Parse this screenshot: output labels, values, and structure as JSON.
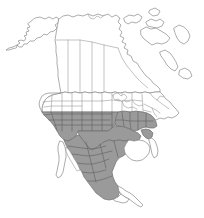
{
  "figure": {
    "type": "range-map",
    "width": 204,
    "height": 218,
    "background_color": "#ffffff",
    "has_legend": false,
    "has_labels": false,
    "has_title_text": false,
    "has_scale_bar": false,
    "has_compass": false,
    "has_graticule": false
  },
  "colors": {
    "background": "#ffffff",
    "land_fill": "#ffffff",
    "coastline_stroke": "#8a8a8a",
    "subdivision_stroke": "#9a9a9a",
    "range_fill": "#9a9a9a",
    "range_stroke": "#6f6f6f",
    "range_subdivision_stroke": "#5f5f5f"
  },
  "map": {
    "projection_extent": "North America including Alaska, Canada, Greenland margin, continental United States, Mexico and Central America approach",
    "regions": [
      {
        "id": "alaska",
        "label": "Alaska",
        "shaded": false
      },
      {
        "id": "canada",
        "label": "Canada",
        "shaded": false,
        "has_province_divisions": true
      },
      {
        "id": "united-states",
        "label": "United States",
        "shaded": "partial",
        "has_state_divisions": true
      },
      {
        "id": "mexico",
        "label": "Mexico",
        "shaded": "partial",
        "has_state_divisions": true
      },
      {
        "id": "baja-california",
        "label": "Baja California Peninsula",
        "shaded": false
      },
      {
        "id": "yucatan",
        "label": "Yucatan Peninsula",
        "shaded": false
      },
      {
        "id": "great-lakes",
        "label": "Great Lakes",
        "shaded": false,
        "is_water": true
      }
    ],
    "range_description": "Shaded distribution spans the southwestern United States, southern Great Plains, Gulf Coast states, Florida panhandle and adjoining southeastern states, and most of mainland Mexico excluding the Baja California and Yucatan peninsulas.",
    "range_areas": [
      "southern California",
      "Nevada (southern)",
      "Utah (southern)",
      "Arizona",
      "New Mexico",
      "Colorado (southern)",
      "Kansas (southern)",
      "Oklahoma",
      "Texas",
      "Louisiana",
      "Arkansas (southern)",
      "Mississippi",
      "Alabama",
      "Georgia",
      "South Carolina (southern)",
      "Florida (northern)",
      "Sonora",
      "Chihuahua",
      "Coahuila",
      "Nuevo Leon",
      "Tamaulipas",
      "Sinaloa",
      "Durango",
      "Zacatecas",
      "San Luis Potosi",
      "Jalisco",
      "Michoacan",
      "Guerrero",
      "Oaxaca",
      "Veracruz",
      "Chiapas"
    ],
    "unshaded_areas": [
      "Alaska",
      "Yukon",
      "Northwest Territories",
      "Nunavut",
      "British Columbia",
      "Alberta",
      "Saskatchewan",
      "Manitoba",
      "Ontario",
      "Quebec",
      "Newfoundland and Labrador",
      "Maritime Provinces",
      "Pacific Northwest",
      "Northern Rockies",
      "Northern Great Plains",
      "Midwest",
      "Great Lakes region",
      "Northeast United States",
      "Mid-Atlantic",
      "Baja California Peninsula",
      "Yucatan Peninsula"
    ]
  }
}
